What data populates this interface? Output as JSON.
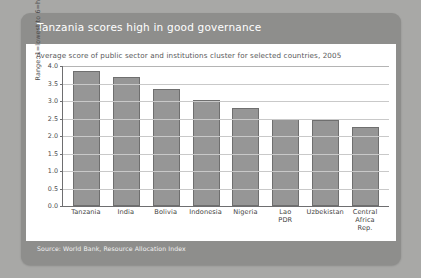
{
  "card": {
    "title": "Tanzania scores high in good governance",
    "subtitle": "Average score of public sector and institutions cluster for selected countries, 2005",
    "source": "Source: World Bank, Resource Allocation Index",
    "header_color": "#8e8e8c",
    "panel_color": "#ffffff",
    "page_background": "#a8a8a6"
  },
  "chart_data": {
    "type": "bar",
    "title": "Tanzania scores high in good governance",
    "subtitle": "Average score of public sector and institutions cluster for selected countries, 2005",
    "categories": [
      "Tanzania",
      "India",
      "Bolivia",
      "Indonesia",
      "Nigeria",
      "Lao PDR",
      "Uzbekistan",
      "Central Africa Rep."
    ],
    "category_lines": [
      [
        "Tanzania"
      ],
      [
        "India"
      ],
      [
        "Bolivia"
      ],
      [
        "Indonesia"
      ],
      [
        "Nigeria"
      ],
      [
        "Lao",
        "PDR"
      ],
      [
        "Uzbekistan"
      ],
      [
        "Central",
        "Africa",
        "Rep."
      ]
    ],
    "values": [
      3.85,
      3.7,
      3.35,
      3.02,
      2.8,
      2.5,
      2.45,
      2.25
    ],
    "xlabel": "",
    "ylabel": "Range: 1=lowest to 6=highest",
    "ylim": [
      0.0,
      4.0
    ],
    "yticks": [
      "4.0",
      "3.5",
      "3.0",
      "2.5",
      "2.0",
      "1.5",
      "1.0",
      "0.5",
      "0.0"
    ],
    "ytick_values": [
      4.0,
      3.5,
      3.0,
      2.5,
      2.0,
      1.5,
      1.0,
      0.5,
      0.0
    ],
    "grid": true,
    "legend": null,
    "bar_color": "#969696",
    "bar_border_color": "#6f6f6f",
    "grid_color": "#c9c9c9",
    "axis_color": "#6e6e70"
  }
}
